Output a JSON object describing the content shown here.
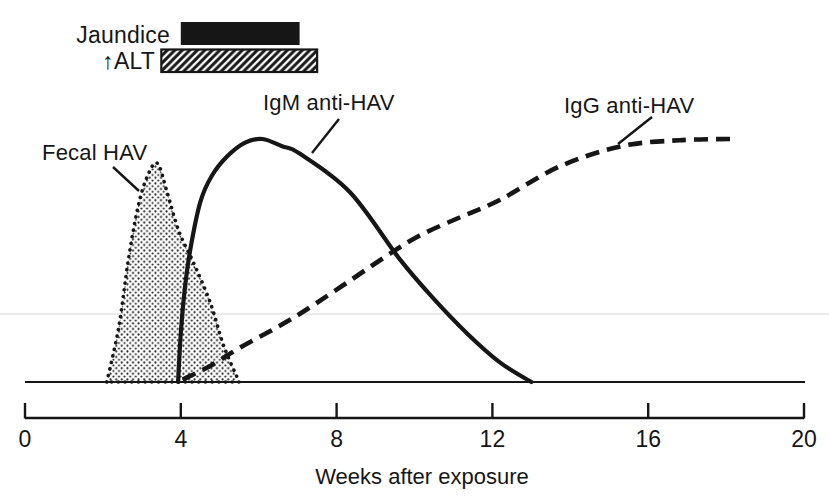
{
  "colors": {
    "ink": "#161616",
    "paper": "#ffffff",
    "scan_artifact_line": "#e4e4e4"
  },
  "labels": {
    "jaundice": "Jaundice",
    "alt": "↑ALT",
    "fecal": "Fecal HAV",
    "igm": "IgM anti-HAV",
    "igg": "IgG anti-HAV"
  },
  "chart_data": {
    "type": "line",
    "xlabel": "Weeks after exposure",
    "x_ticks": [
      "0",
      "4",
      "8",
      "12",
      "16",
      "20"
    ],
    "x_range": [
      0,
      20
    ],
    "y_axis": "relative level (unlabeled, qualitative)",
    "grid": false,
    "legend": "inline labels with leader lines",
    "bars": [
      {
        "name": "Jaundice",
        "week_start": 4.0,
        "week_end": 7.05,
        "fill": "solid-black"
      },
      {
        "name": "↑ALT",
        "week_start": 3.5,
        "week_end": 7.5,
        "fill": "diagonal-hatch"
      }
    ],
    "series": [
      {
        "name": "Fecal HAV",
        "style": "dotted-outline-stippled-fill",
        "points": [
          [
            2.1,
            0
          ],
          [
            2.4,
            0.22
          ],
          [
            2.65,
            0.5
          ],
          [
            2.9,
            0.72
          ],
          [
            3.15,
            0.85
          ],
          [
            3.4,
            0.9
          ],
          [
            3.65,
            0.78
          ],
          [
            3.95,
            0.62
          ],
          [
            4.3,
            0.5
          ],
          [
            4.75,
            0.33
          ],
          [
            5.1,
            0.15
          ],
          [
            5.5,
            0
          ]
        ]
      },
      {
        "name": "IgM anti-HAV",
        "style": "solid",
        "points": [
          [
            3.93,
            0
          ],
          [
            4.0,
            0.2
          ],
          [
            4.1,
            0.38
          ],
          [
            4.25,
            0.55
          ],
          [
            4.5,
            0.74
          ],
          [
            4.8,
            0.85
          ],
          [
            5.2,
            0.93
          ],
          [
            5.65,
            0.985
          ],
          [
            6.1,
            1.0
          ],
          [
            6.6,
            0.97
          ],
          [
            7.05,
            0.94
          ],
          [
            8.35,
            0.78
          ],
          [
            9.6,
            0.51
          ],
          [
            10.45,
            0.35
          ],
          [
            11.35,
            0.2
          ],
          [
            12.2,
            0.08
          ],
          [
            13.0,
            0
          ]
        ]
      },
      {
        "name": "IgG anti-HAV",
        "style": "dashed",
        "points": [
          [
            4.05,
            0.01
          ],
          [
            4.8,
            0.07
          ],
          [
            5.5,
            0.14
          ],
          [
            6.3,
            0.21
          ],
          [
            7.05,
            0.28
          ],
          [
            8.0,
            0.38
          ],
          [
            9.2,
            0.51
          ],
          [
            10.1,
            0.6
          ],
          [
            11.2,
            0.68
          ],
          [
            12.2,
            0.75
          ],
          [
            13.7,
            0.885
          ],
          [
            15.3,
            0.97
          ],
          [
            16.8,
            0.995
          ],
          [
            18.1,
            1.0
          ]
        ]
      }
    ]
  }
}
